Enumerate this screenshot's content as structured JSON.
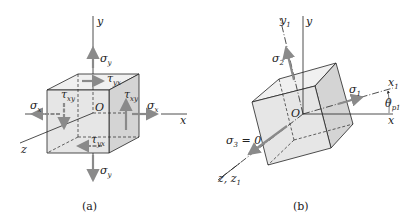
{
  "figure_a": {
    "caption": "(a)",
    "axes": {
      "x": "x",
      "y": "y",
      "z": "z",
      "origin": "O"
    },
    "stresses": {
      "sigma_x_left": {
        "sym": "σ",
        "sub": "x"
      },
      "sigma_x_right": {
        "sym": "σ",
        "sub": "x"
      },
      "sigma_y_top": {
        "sym": "σ",
        "sub": "y"
      },
      "sigma_y_bottom": {
        "sym": "σ",
        "sub": "y"
      },
      "tau_yx_top": {
        "sym": "τ",
        "sub": "yx"
      },
      "tau_yx_bottom": {
        "sym": "τ",
        "sub": "yx"
      },
      "tau_xy_left": {
        "sym": "τ",
        "sub": "xy"
      },
      "tau_xy_right": {
        "sym": "τ",
        "sub": "xy"
      }
    }
  },
  "figure_b": {
    "caption": "(b)",
    "axes": {
      "x": "x",
      "y": "y",
      "x1": {
        "sym": "x",
        "sub": "1"
      },
      "y1": {
        "sym": "y",
        "sub": "1"
      },
      "z": "z, z",
      "z_sub": "1",
      "origin": "O"
    },
    "stresses": {
      "sigma_1": {
        "sym": "σ",
        "sub": "1"
      },
      "sigma_2": {
        "sym": "σ",
        "sub": "2"
      },
      "sigma_3": {
        "sym": "σ",
        "sub": "3",
        "suffix": " = 0"
      }
    },
    "angle": {
      "sym": "θ",
      "sub": "p1"
    }
  },
  "colors": {
    "face_front": "#e6e6e6",
    "face_side": "#d4d4d4",
    "face_top": "#f0f0f0",
    "arrow": "#8a8a8a",
    "line": "#222222"
  }
}
